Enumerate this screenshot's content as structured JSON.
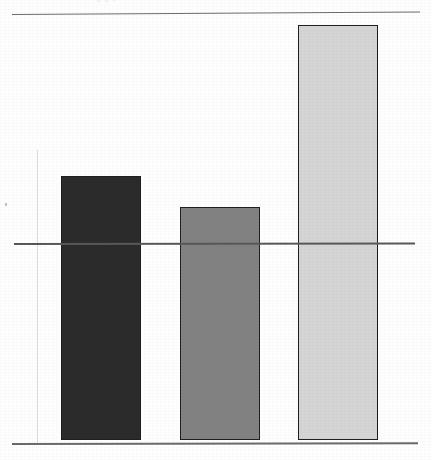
{
  "page": {
    "width": 432,
    "height": 460,
    "background": "#fefefe",
    "appearance": "scanned-photocopy"
  },
  "clipped_caption": {
    "text": "g  g  (",
    "note": "illegible descenders of a text line clipped at the top crop edge"
  },
  "chart_data": {
    "type": "bar",
    "title": "",
    "subtitle": "",
    "xlabel": "",
    "ylabel": "",
    "categories": [
      "1",
      "2",
      "3"
    ],
    "values": [
      1.34,
      1.18,
      2.09
    ],
    "series": [
      {
        "name": "series-1",
        "values": [
          1.34,
          1.18,
          2.09
        ]
      }
    ],
    "ylim": [
      0,
      2.16
    ],
    "grid": true,
    "gridlines": [
      1.0,
      2.16
    ],
    "legend": "none",
    "tick_labels": {
      "x": [
        "",
        "",
        ""
      ],
      "y": [
        "",
        "",
        ""
      ]
    },
    "annotations": [],
    "bar_colors": [
      "#2b2b2b",
      "#828282",
      "#d5d5d5"
    ],
    "bar_outline_color": "#1f1f1f",
    "axis_color": "#585858"
  },
  "bars": [
    {
      "name": "bar-1",
      "label": "",
      "value": 1.34,
      "color": "#2b2b2b",
      "x": 61,
      "width": 80,
      "top": 176,
      "bottom": 440
    },
    {
      "name": "bar-2",
      "label": "",
      "value": 1.18,
      "color": "#828282",
      "x": 180,
      "width": 80,
      "top": 207,
      "bottom": 440
    },
    {
      "name": "bar-3",
      "label": "",
      "value": 2.09,
      "color": "#d5d5d5",
      "x": 298,
      "width": 80,
      "top": 25,
      "bottom": 440
    }
  ],
  "rules": [
    {
      "name": "top-rule",
      "y": 14,
      "x1": 12,
      "x2": 420,
      "color": "#6d6d6d"
    },
    {
      "name": "mid-rule",
      "y": 243,
      "x1": 14,
      "x2": 415,
      "color": "#585858"
    },
    {
      "name": "baseline-rule",
      "y": 443,
      "x1": 12,
      "x2": 418,
      "color": "#6a6a6a"
    }
  ]
}
